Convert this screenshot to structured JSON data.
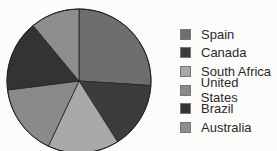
{
  "chart_data": {
    "type": "pie",
    "title": "",
    "categories": [
      "Spain",
      "Canada",
      "South Africa",
      "United States",
      "Brazil",
      "Australia"
    ],
    "values": [
      26,
      15,
      16,
      16,
      16,
      11
    ],
    "colors": [
      "#6e6e6e",
      "#3c3c3c",
      "#a9a9a9",
      "#8a8a8a",
      "#333333",
      "#8e8e8e"
    ],
    "start_angle": "12 o'clock",
    "direction": "clockwise",
    "legend_position": "right",
    "data_labels": false
  },
  "legend": {
    "items": [
      {
        "label": "Spain",
        "color": "#6e6e6e"
      },
      {
        "label": "Canada",
        "color": "#3c3c3c"
      },
      {
        "label": "South Africa",
        "color": "#a9a9a9"
      },
      {
        "label": "United States",
        "color": "#8a8a8a"
      },
      {
        "label": "Brazil",
        "color": "#333333"
      },
      {
        "label": "Australia",
        "color": "#8e8e8e"
      }
    ]
  }
}
